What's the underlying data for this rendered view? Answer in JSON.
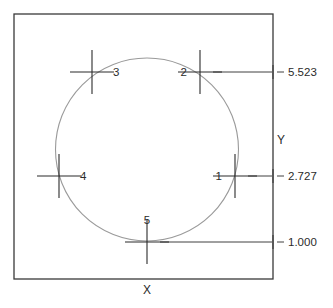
{
  "drawing": {
    "title": "Circle point dimension diagram",
    "frame": {
      "name": "drawing-border",
      "x": 14,
      "y": 14,
      "width": 259,
      "height": 265,
      "stroke": "#3a3a3a",
      "stroke_width": 1.3
    },
    "circle": {
      "name": "circle-profile",
      "cx": 147,
      "cy": 149.5,
      "r": 91.5,
      "stroke": "#9a9a9a",
      "stroke_width": 1.1,
      "fill": "none"
    },
    "axes": {
      "x_label": "X",
      "y_label": "Y",
      "x_label_pos": {
        "x": 147,
        "y": 294
      },
      "y_label_pos": {
        "x": 281,
        "y": 144
      }
    },
    "marker_style": {
      "stroke": "#2b2b2b",
      "stroke_width": 1.1,
      "arm_short": 16,
      "arm_long": 22
    },
    "points": [
      {
        "id": "point-1",
        "label": "1",
        "cx": 235,
        "cy": 176,
        "label_x": 222,
        "label_y": 180,
        "label_anchor": "end",
        "leader": {
          "x1": 248,
          "x2": 272,
          "y": 176
        }
      },
      {
        "id": "point-2",
        "label": "2",
        "cx": 200,
        "cy": 72,
        "label_x": 187,
        "label_y": 76,
        "label_anchor": "end",
        "leader": {
          "x1": 213,
          "x2": 272,
          "y": 72
        }
      },
      {
        "id": "point-3",
        "label": "3",
        "cx": 92,
        "cy": 72,
        "label_x": 113,
        "label_y": 76,
        "label_anchor": "start",
        "leader": null
      },
      {
        "id": "point-4",
        "label": "4",
        "cx": 59,
        "cy": 176,
        "label_x": 80,
        "label_y": 180,
        "label_anchor": "start",
        "leader": null
      },
      {
        "id": "point-5",
        "label": "5",
        "cx": 147,
        "cy": 242,
        "label_x": 147,
        "label_y": 224,
        "label_anchor": "middle",
        "leader": {
          "x1": 160,
          "x2": 272,
          "y": 242
        }
      }
    ],
    "dimensions": [
      {
        "id": "dimension-5523",
        "value": "5.523",
        "y": 72,
        "text_x": 288,
        "text_y": 76,
        "tick_x": 273,
        "dash_x1": 277,
        "dash_x2": 284
      },
      {
        "id": "dimension-2727",
        "value": "2.727",
        "y": 176,
        "text_x": 288,
        "text_y": 180,
        "tick_x": 273,
        "dash_x1": 277,
        "dash_x2": 284
      },
      {
        "id": "dimension-1000",
        "value": "1.000",
        "y": 242,
        "text_x": 288,
        "text_y": 246,
        "tick_x": 273,
        "dash_x1": 277,
        "dash_x2": 284
      }
    ]
  }
}
